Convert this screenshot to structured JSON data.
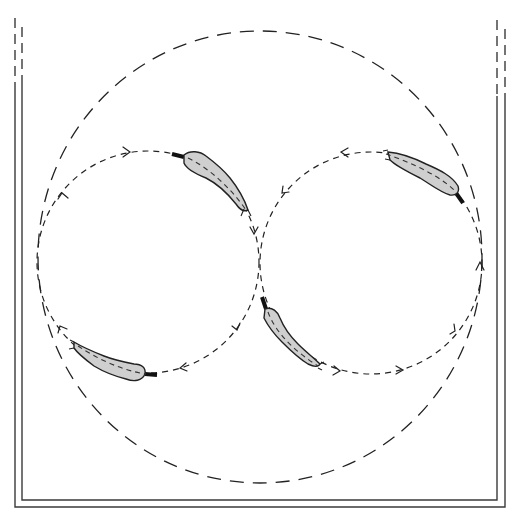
{
  "figure": {
    "colors": {
      "background": "#ffffff",
      "line": "#222222",
      "fish_fill": "#cfcfcf",
      "fish_head": "#111111"
    },
    "tank": {
      "walls": "double-line U-shaped tank walls, dashed at top ends",
      "left_outer_x": 15,
      "left_inner_x": 22,
      "right_inner_x": 497,
      "right_outer_x": 505,
      "bottom_inner_y": 500,
      "bottom_outer_y": 507
    },
    "paths": [
      {
        "name": "outer-circle",
        "cx": 260,
        "cy": 257,
        "r": 224,
        "style": "long-dash"
      },
      {
        "name": "left-loop",
        "cx": 148,
        "cy": 262,
        "r": 111,
        "style": "short-dash",
        "direction": "clockwise"
      },
      {
        "name": "right-loop",
        "cx": 371,
        "cy": 263,
        "r": 111,
        "style": "short-dash",
        "direction": "counter-clockwise"
      }
    ],
    "fish": [
      {
        "id": "fish-1",
        "loop": "left-loop",
        "position": "top-right of left loop"
      },
      {
        "id": "fish-2",
        "loop": "right-loop",
        "position": "top-right of right loop"
      },
      {
        "id": "fish-3",
        "loop": "left-loop",
        "position": "bottom-left of left loop"
      },
      {
        "id": "fish-4",
        "loop": "right-loop",
        "position": "bottom-left of right loop"
      }
    ],
    "arrow_count": 12
  }
}
